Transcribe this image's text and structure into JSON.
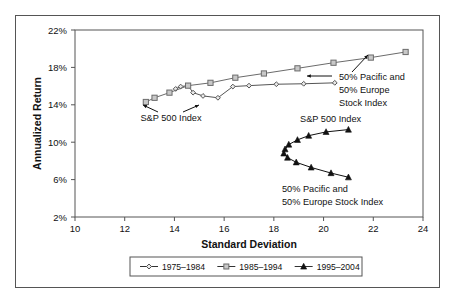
{
  "chart_data": {
    "type": "scatter",
    "title": "",
    "xlabel": "Standard Deviation",
    "ylabel": "Annualized Return",
    "xlim": [
      10,
      24
    ],
    "ylim": [
      2,
      22
    ],
    "xticks": [
      10,
      12,
      14,
      16,
      18,
      20,
      22,
      24
    ],
    "yticks": [
      "2%",
      "6%",
      "10%",
      "14%",
      "18%",
      "22%"
    ],
    "ytick_values": [
      2,
      6,
      10,
      14,
      18,
      22
    ],
    "grid": false,
    "legend_position": "bottom",
    "series": [
      {
        "name": "1975–1984",
        "marker": "diamond",
        "color": "#555555",
        "points": [
          {
            "x": 14.05,
            "y": 15.7
          },
          {
            "x": 14.25,
            "y": 15.95
          },
          {
            "x": 14.55,
            "y": 16.05
          },
          {
            "x": 14.75,
            "y": 15.3
          },
          {
            "x": 15.15,
            "y": 14.95
          },
          {
            "x": 15.75,
            "y": 14.75
          },
          {
            "x": 16.35,
            "y": 15.95
          },
          {
            "x": 17.0,
            "y": 16.05
          },
          {
            "x": 18.1,
            "y": 16.2
          },
          {
            "x": 19.2,
            "y": 16.25
          },
          {
            "x": 20.45,
            "y": 16.35
          }
        ]
      },
      {
        "name": "1985–1994",
        "marker": "square",
        "color": "#6b6b6b",
        "points": [
          {
            "x": 12.85,
            "y": 14.3
          },
          {
            "x": 13.2,
            "y": 14.75
          },
          {
            "x": 13.8,
            "y": 15.3
          },
          {
            "x": 14.55,
            "y": 16.05
          },
          {
            "x": 15.45,
            "y": 16.35
          },
          {
            "x": 16.45,
            "y": 16.9
          },
          {
            "x": 17.6,
            "y": 17.35
          },
          {
            "x": 18.95,
            "y": 17.9
          },
          {
            "x": 20.4,
            "y": 18.5
          },
          {
            "x": 21.9,
            "y": 19.05
          },
          {
            "x": 23.3,
            "y": 19.65
          }
        ]
      },
      {
        "name": "1995–2004",
        "marker": "triangle",
        "color": "#111111",
        "points": [
          {
            "x": 21.0,
            "y": 11.35
          },
          {
            "x": 20.1,
            "y": 11.1
          },
          {
            "x": 19.4,
            "y": 10.7
          },
          {
            "x": 18.95,
            "y": 10.25
          },
          {
            "x": 18.6,
            "y": 9.75
          },
          {
            "x": 18.45,
            "y": 9.25
          },
          {
            "x": 18.4,
            "y": 8.8
          },
          {
            "x": 18.55,
            "y": 8.35
          },
          {
            "x": 18.9,
            "y": 7.85
          },
          {
            "x": 19.5,
            "y": 7.3
          },
          {
            "x": 20.3,
            "y": 6.7
          },
          {
            "x": 21.0,
            "y": 6.25
          }
        ]
      }
    ],
    "annotations": [
      {
        "id": "sp500-left",
        "text": "S&P 500 Index",
        "x": 14.4,
        "y": 12.9
      },
      {
        "id": "pacific-europe-right",
        "text_lines": [
          "50% Pacific and",
          "50% Europe",
          "Stock Index"
        ],
        "x": 19.0,
        "y": 16.4
      },
      {
        "id": "sp500-right",
        "text": "S&P 500 Index",
        "x": 20.3,
        "y": 12.5
      },
      {
        "id": "pacific-europe-bottom",
        "text_lines": [
          "50% Pacific and",
          "50% Europe Stock Index"
        ],
        "x": 19.3,
        "y": 5.0
      }
    ]
  },
  "axes": {
    "x_title": "Standard Deviation",
    "y_title": "Annualized Return",
    "x_tick_labels": [
      "10",
      "12",
      "14",
      "16",
      "18",
      "20",
      "22",
      "24"
    ],
    "y_tick_labels": [
      "2%",
      "6%",
      "10%",
      "14%",
      "18%",
      "22%"
    ]
  },
  "legend": {
    "entries": [
      {
        "label": "1975–1984",
        "marker": "diamond"
      },
      {
        "label": "1985–1994",
        "marker": "square"
      },
      {
        "label": "1995–2004",
        "marker": "triangle"
      }
    ]
  },
  "annotations": {
    "sp500_left": "S&P 500 Index",
    "pacific_europe_l1": "50% Pacific and",
    "pacific_europe_l2": "50% Europe",
    "pacific_europe_l3": "Stock Index",
    "sp500_right": "S&P 500 Index",
    "pe_bottom_l1": "50% Pacific and",
    "pe_bottom_l2": "50% Europe Stock Index"
  },
  "colors": {
    "series_1975": "#555555",
    "series_1985": "#6b6b6b",
    "series_1995": "#111111",
    "axis": "#555555",
    "text": "#111111",
    "background": "#ffffff"
  }
}
